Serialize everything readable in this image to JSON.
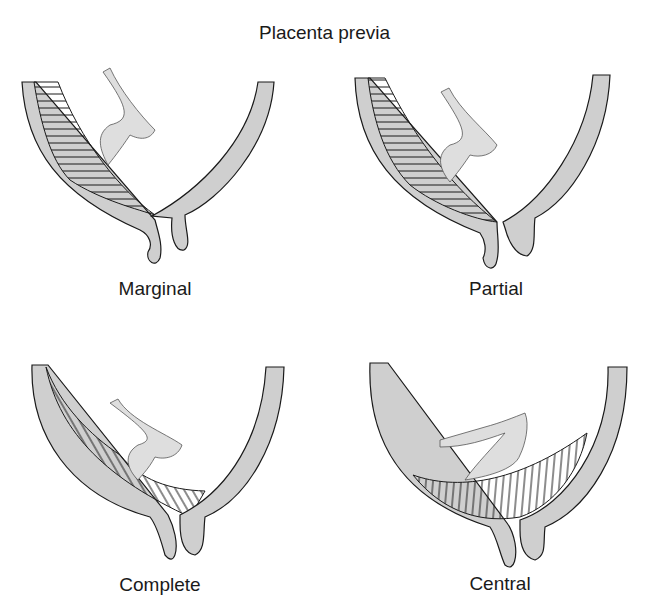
{
  "title": "Placenta previa",
  "colors": {
    "wall": "#cfcfcf",
    "outline": "#1a1a1a",
    "placenta_fill": "#f6f6f6",
    "cord": "#dedede"
  },
  "panels": [
    {
      "label": "Marginal"
    },
    {
      "label": "Partial"
    },
    {
      "label": "Complete"
    },
    {
      "label": "Central"
    }
  ]
}
